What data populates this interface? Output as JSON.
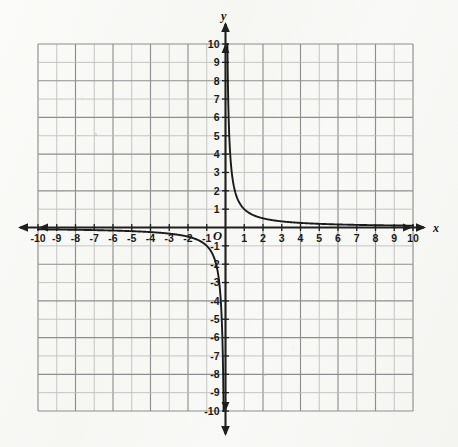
{
  "figure": {
    "kind": "coordinate-grid-graph",
    "background_color": "#f8f8f6",
    "ink_color": "#1a1a1a",
    "grid_color": "#a9a9a9",
    "axis_color": "#222222"
  },
  "axes": {
    "x_axis_name": "x",
    "y_axis_name": "y",
    "origin_label": "O",
    "x_tick_labels": [
      "-10",
      "-9",
      "-8",
      "-7",
      "-6",
      "-5",
      "-4",
      "-3",
      "-2",
      "-1",
      "1",
      "2",
      "3",
      "4",
      "5",
      "6",
      "7",
      "8",
      "9",
      "10"
    ],
    "y_tick_labels_positive": [
      "1",
      "2",
      "3",
      "4",
      "5",
      "6",
      "7",
      "8",
      "9",
      "10"
    ],
    "y_tick_labels_negative": [
      "-1",
      "-2",
      "-3",
      "-4",
      "-5",
      "-6",
      "-7",
      "-8",
      "-9",
      "-10"
    ]
  },
  "chart_data": {
    "type": "line",
    "title": "",
    "subtitle": "",
    "xlabel": "x",
    "ylabel": "y",
    "xlim": [
      -10,
      10
    ],
    "ylim": [
      -10,
      10
    ],
    "xticks": [
      -10,
      -9,
      -8,
      -7,
      -6,
      -5,
      -4,
      -3,
      -2,
      -1,
      0,
      1,
      2,
      3,
      4,
      5,
      6,
      7,
      8,
      9,
      10
    ],
    "yticks": [
      -10,
      -9,
      -8,
      -7,
      -6,
      -5,
      -4,
      -3,
      -2,
      -1,
      0,
      1,
      2,
      3,
      4,
      5,
      6,
      7,
      8,
      9,
      10
    ],
    "grid": true,
    "grid_spacing": 1,
    "legend": false,
    "legend_position": "none",
    "annotations": [],
    "series": [
      {
        "name": "y = 1/x (branch x > 0)",
        "equation": "y = 1/x",
        "color": "#1a1a1a",
        "x": [
          0.1,
          0.11,
          0.12,
          0.13,
          0.15,
          0.17,
          0.2,
          0.25,
          0.3,
          0.35,
          0.4,
          0.5,
          0.6,
          0.7,
          0.8,
          0.9,
          1.0,
          1.25,
          1.5,
          1.75,
          2.0,
          2.5,
          3.0,
          3.5,
          4.0,
          5.0,
          6.0,
          7.0,
          8.0,
          9.0,
          10.0
        ],
        "y": [
          10.0,
          9.09,
          8.33,
          7.69,
          6.67,
          5.88,
          5.0,
          4.0,
          3.33,
          2.86,
          2.5,
          2.0,
          1.67,
          1.43,
          1.25,
          1.11,
          1.0,
          0.8,
          0.67,
          0.57,
          0.5,
          0.4,
          0.33,
          0.29,
          0.25,
          0.2,
          0.17,
          0.14,
          0.13,
          0.11,
          0.1
        ]
      },
      {
        "name": "y = 1/x (branch x < 0)",
        "equation": "y = 1/x",
        "color": "#1a1a1a",
        "x": [
          -10.0,
          -9.0,
          -8.0,
          -7.0,
          -6.0,
          -5.0,
          -4.0,
          -3.5,
          -3.0,
          -2.5,
          -2.0,
          -1.75,
          -1.5,
          -1.25,
          -1.0,
          -0.9,
          -0.8,
          -0.7,
          -0.6,
          -0.5,
          -0.4,
          -0.35,
          -0.3,
          -0.25,
          -0.2,
          -0.17,
          -0.15,
          -0.13,
          -0.12,
          -0.11,
          -0.1
        ],
        "y": [
          -0.1,
          -0.11,
          -0.13,
          -0.14,
          -0.17,
          -0.2,
          -0.25,
          -0.29,
          -0.33,
          -0.4,
          -0.5,
          -0.57,
          -0.67,
          -0.8,
          -1.0,
          -1.11,
          -1.25,
          -1.43,
          -1.67,
          -2.0,
          -2.5,
          -2.86,
          -3.33,
          -4.0,
          -5.0,
          -5.88,
          -6.67,
          -7.69,
          -8.33,
          -9.09,
          -10.0
        ]
      }
    ],
    "asymptotes": {
      "vertical": 0,
      "horizontal": 0
    }
  }
}
